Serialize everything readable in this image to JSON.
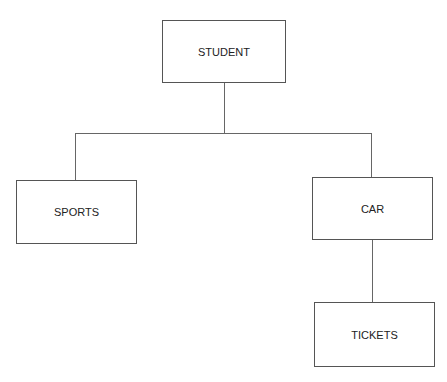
{
  "diagram": {
    "type": "hierarchy",
    "nodes": {
      "root": {
        "label": "STUDENT"
      },
      "left": {
        "label": "SPORTS"
      },
      "right": {
        "label": "CAR"
      },
      "right_child": {
        "label": "TICKETS"
      }
    },
    "edges": [
      [
        "STUDENT",
        "SPORTS"
      ],
      [
        "STUDENT",
        "CAR"
      ],
      [
        "CAR",
        "TICKETS"
      ]
    ]
  }
}
